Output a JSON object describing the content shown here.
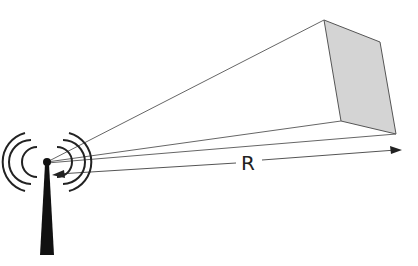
{
  "diagram": {
    "range_label": "R",
    "colors": {
      "line": "#555555",
      "face": "#d4d4d4",
      "antenna": "#111111"
    }
  }
}
